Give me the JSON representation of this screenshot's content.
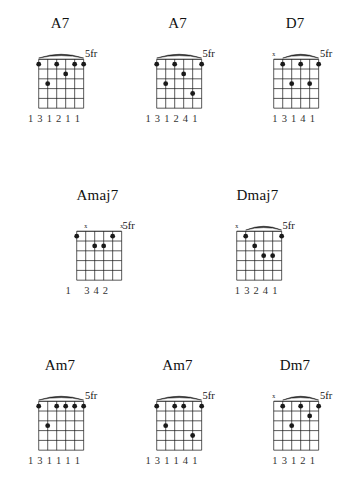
{
  "page": {
    "ink_color": "#1a1a1a",
    "background_color": "#ffffff",
    "string_count": 6,
    "fret_count": 5
  },
  "chart_data": {
    "type": "table",
    "xlabel": "Strings (6 lowest to 1 highest)",
    "ylabel": "Frets",
    "legend": [
      "dot = fretted note",
      "x = muted string",
      "number = fretting finger"
    ],
    "categories": [
      "A7",
      "A7",
      "D7",
      "Amaj7",
      "Dmaj7",
      "Am7",
      "Am7",
      "Dm7"
    ],
    "rows": [
      {
        "row_index": 0,
        "chords": [
          {
            "name": "A7",
            "position_label": "5fr",
            "position_fret": 5,
            "markers": [
              "",
              "",
              "",
              "",
              "",
              ""
            ],
            "dots": [
              {
                "string": 6,
                "fret": 1
              },
              {
                "string": 5,
                "fret": 3
              },
              {
                "string": 4,
                "fret": 1
              },
              {
                "string": 3,
                "fret": 2
              },
              {
                "string": 2,
                "fret": 1
              },
              {
                "string": 1,
                "fret": 1
              }
            ],
            "fingers": [
              "1",
              "3",
              "1",
              "2",
              "1",
              "1"
            ],
            "has_arc": true
          },
          {
            "name": "A7",
            "position_label": "5fr",
            "position_fret": 5,
            "markers": [
              "",
              "",
              "",
              "",
              "",
              ""
            ],
            "dots": [
              {
                "string": 6,
                "fret": 1
              },
              {
                "string": 5,
                "fret": 3
              },
              {
                "string": 4,
                "fret": 1
              },
              {
                "string": 3,
                "fret": 2
              },
              {
                "string": 2,
                "fret": 4
              },
              {
                "string": 1,
                "fret": 1
              }
            ],
            "fingers": [
              "1",
              "3",
              "1",
              "2",
              "4",
              "1"
            ],
            "has_arc": true
          },
          {
            "name": "D7",
            "position_label": "5fr",
            "position_fret": 5,
            "markers": [
              "x",
              "",
              "",
              "",
              "",
              ""
            ],
            "dots": [
              {
                "string": 5,
                "fret": 1
              },
              {
                "string": 4,
                "fret": 3
              },
              {
                "string": 3,
                "fret": 1
              },
              {
                "string": 2,
                "fret": 3
              },
              {
                "string": 1,
                "fret": 1
              }
            ],
            "fingers": [
              "",
              "1",
              "3",
              "1",
              "4",
              "1"
            ],
            "has_arc": true
          }
        ]
      },
      {
        "row_index": 1,
        "chords": [
          {
            "name": "Amaj7",
            "position_label": "5fr",
            "position_fret": 5,
            "markers": [
              "",
              "x",
              "",
              "",
              "",
              "x"
            ],
            "dots": [
              {
                "string": 6,
                "fret": 1
              },
              {
                "string": 4,
                "fret": 2
              },
              {
                "string": 3,
                "fret": 2
              },
              {
                "string": 2,
                "fret": 1
              }
            ],
            "fingers": [
              "1",
              "",
              "3",
              "4",
              "2",
              ""
            ],
            "has_arc": false
          },
          {
            "name": "Dmaj7",
            "position_label": "5fr",
            "position_fret": 5,
            "markers": [
              "x",
              "",
              "",
              "",
              "",
              ""
            ],
            "dots": [
              {
                "string": 5,
                "fret": 1
              },
              {
                "string": 4,
                "fret": 2
              },
              {
                "string": 3,
                "fret": 3
              },
              {
                "string": 2,
                "fret": 3
              },
              {
                "string": 1,
                "fret": 1
              }
            ],
            "fingers": [
              "",
              "1",
              "3",
              "2",
              "4",
              "1"
            ],
            "has_arc": true
          }
        ]
      },
      {
        "row_index": 2,
        "chords": [
          {
            "name": "Am7",
            "position_label": "5fr",
            "position_fret": 5,
            "markers": [
              "",
              "",
              "",
              "",
              "",
              ""
            ],
            "dots": [
              {
                "string": 6,
                "fret": 1
              },
              {
                "string": 5,
                "fret": 3
              },
              {
                "string": 4,
                "fret": 1
              },
              {
                "string": 3,
                "fret": 1
              },
              {
                "string": 2,
                "fret": 1
              },
              {
                "string": 1,
                "fret": 1
              }
            ],
            "fingers": [
              "1",
              "3",
              "1",
              "1",
              "1",
              "1"
            ],
            "has_arc": true
          },
          {
            "name": "Am7",
            "position_label": "5fr",
            "position_fret": 5,
            "markers": [
              "",
              "",
              "",
              "",
              "",
              ""
            ],
            "dots": [
              {
                "string": 6,
                "fret": 1
              },
              {
                "string": 5,
                "fret": 3
              },
              {
                "string": 4,
                "fret": 1
              },
              {
                "string": 3,
                "fret": 1
              },
              {
                "string": 2,
                "fret": 4
              },
              {
                "string": 1,
                "fret": 1
              }
            ],
            "fingers": [
              "1",
              "3",
              "1",
              "1",
              "4",
              "1"
            ],
            "has_arc": true
          },
          {
            "name": "Dm7",
            "position_label": "5fr",
            "position_fret": 5,
            "markers": [
              "x",
              "",
              "",
              "",
              "",
              ""
            ],
            "dots": [
              {
                "string": 5,
                "fret": 1
              },
              {
                "string": 4,
                "fret": 3
              },
              {
                "string": 3,
                "fret": 1
              },
              {
                "string": 2,
                "fret": 2
              },
              {
                "string": 1,
                "fret": 1
              }
            ],
            "fingers": [
              "",
              "1",
              "3",
              "1",
              "2",
              "1"
            ],
            "has_arc": true
          }
        ]
      }
    ]
  }
}
